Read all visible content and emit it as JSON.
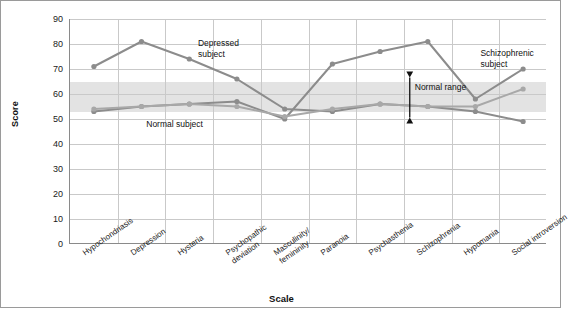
{
  "chart_data": {
    "type": "line",
    "title": "",
    "xlabel": "Scale",
    "ylabel": "Score",
    "ylim": [
      0,
      90
    ],
    "yticks": [
      0,
      10,
      20,
      30,
      40,
      50,
      60,
      70,
      80,
      90
    ],
    "grid": true,
    "legend": "none",
    "categories": [
      "Hypochondriasis",
      "Depression",
      "Hysteria",
      "Psychopathic\ndeviation",
      "Masculinity/\nfemininity",
      "Paranoia",
      "Psychasthenia",
      "Schizophrenia",
      "Hypomania",
      "Social introversion"
    ],
    "series": [
      {
        "name": "Depressed subject",
        "color": "#8c8c8c",
        "values": [
          71,
          81,
          74,
          66,
          54,
          53,
          56,
          55,
          53,
          49
        ]
      },
      {
        "name": "Schizophrenic subject",
        "color": "#8c8c8c",
        "values": [
          53,
          55,
          56,
          57,
          50,
          72,
          77,
          81,
          58,
          70
        ]
      },
      {
        "name": "Normal subject",
        "color": "#a8a8a8",
        "values": [
          54,
          55,
          56,
          55,
          51,
          54,
          56,
          55,
          55,
          62
        ]
      }
    ],
    "shaded_band": {
      "label": "Normal range",
      "from": 53,
      "to": 65,
      "color": "#d9d9d9"
    },
    "annotations": [
      {
        "text": "Depressed\nsubject",
        "x_category": "Psychopathic deviation",
        "value": 80
      },
      {
        "text": "Schizophrenic\nsubject",
        "x_category": "Hypomania",
        "value": 76
      },
      {
        "text": "Normal subject",
        "x_category": "Hysteria",
        "value": 48
      },
      {
        "text": "Normal range",
        "x_category": "Schizophrenia",
        "value": 63
      }
    ]
  }
}
